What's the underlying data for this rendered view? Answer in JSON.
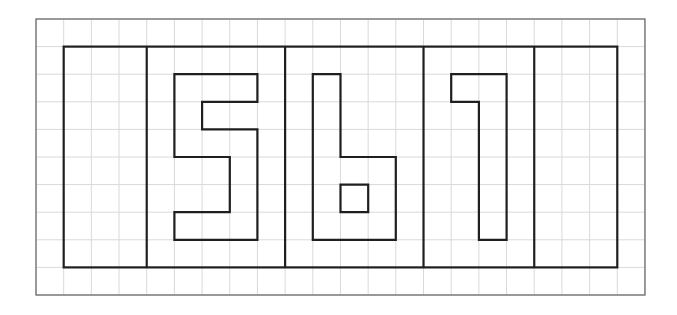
{
  "diagram": {
    "title": "",
    "colors": {
      "background": "#ffffff",
      "grid": "#d9d9d9",
      "border": "#6e6e6e",
      "ink": "#1f1f1f"
    },
    "grid": {
      "origin_x": 36,
      "origin_y": 19,
      "cols": 22,
      "rows": 10,
      "cell_w": 27.68,
      "cell_h": 27.6
    },
    "frame": {
      "top_row": 1,
      "bottom_row": 9,
      "left_col": 1,
      "right_col": 21,
      "dividers_cols": [
        4,
        9,
        14,
        18
      ]
    },
    "digits": [
      {
        "label": "5",
        "paths": [
          [
            [
              5,
              2
            ],
            [
              8,
              2
            ],
            [
              8,
              3
            ],
            [
              6,
              3
            ],
            [
              6,
              4
            ],
            [
              8,
              4
            ],
            [
              8,
              8
            ],
            [
              5,
              8
            ],
            [
              5,
              7
            ],
            [
              7,
              7
            ],
            [
              7,
              5
            ],
            [
              5,
              5
            ]
          ]
        ]
      },
      {
        "label": "6",
        "paths": [
          [
            [
              10,
              2
            ],
            [
              11,
              2
            ],
            [
              11,
              5
            ],
            [
              13,
              5
            ],
            [
              13,
              8
            ],
            [
              10,
              8
            ]
          ],
          [
            [
              11,
              6
            ],
            [
              12,
              6
            ],
            [
              12,
              7
            ],
            [
              11,
              7
            ]
          ]
        ]
      },
      {
        "label": "7",
        "paths": [
          [
            [
              15,
              2
            ],
            [
              17,
              2
            ],
            [
              17,
              8
            ],
            [
              16,
              8
            ],
            [
              16,
              3
            ],
            [
              15,
              3
            ]
          ]
        ]
      }
    ]
  }
}
